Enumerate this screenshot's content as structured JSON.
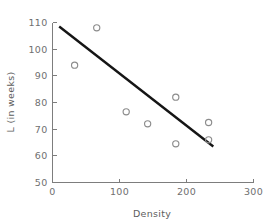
{
  "chart_data": {
    "type": "scatter",
    "title": "",
    "xlabel": "Density",
    "ylabel": "L (in weeks)",
    "xlim": [
      0,
      300
    ],
    "ylim": [
      50,
      110
    ],
    "xticks": [
      "0",
      "100",
      "200",
      "300"
    ],
    "xtick_values": [
      0,
      100,
      200,
      300
    ],
    "yticks": [
      "50",
      "60",
      "70",
      "80",
      "90",
      "100",
      "110"
    ],
    "ytick_values": [
      50,
      60,
      70,
      80,
      90,
      100,
      110
    ],
    "grid": false,
    "legend": "none",
    "marker": "open-circle",
    "points": [
      {
        "x": 33,
        "y": 94
      },
      {
        "x": 66,
        "y": 108
      },
      {
        "x": 110,
        "y": 76.5
      },
      {
        "x": 142,
        "y": 72
      },
      {
        "x": 184,
        "y": 82
      },
      {
        "x": 184,
        "y": 64.5
      },
      {
        "x": 233,
        "y": 72.5
      },
      {
        "x": 233,
        "y": 66
      }
    ],
    "series": [
      {
        "name": "observations",
        "x": [
          33,
          66,
          110,
          142,
          184,
          184,
          233,
          233
        ],
        "values": [
          94,
          108,
          76.5,
          72,
          82,
          64.5,
          72.5,
          66
        ]
      }
    ],
    "annotations": [
      {
        "type": "fit-line",
        "label": "regression line",
        "x0": 10,
        "y0": 108.5,
        "x1": 240,
        "y1": 63.5,
        "color": "#151515"
      }
    ],
    "colors": {
      "marker_stroke": "#8c8c8c",
      "fit_line": "#151515",
      "axis": "#7d7d7d",
      "tick_text": "#6f6f6f",
      "background": "#ffffff"
    }
  },
  "icons": {
    "plot_area": "scatter-plot-icon"
  }
}
